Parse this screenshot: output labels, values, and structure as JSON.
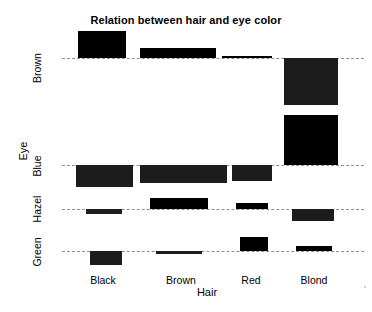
{
  "chart_data": {
    "type": "bar",
    "subtype": "association-plot",
    "title": "Relation between hair and eye color",
    "xlabel": "Hair",
    "ylabel": "Eye",
    "categories": [
      "Black",
      "Brown",
      "Red",
      "Blond"
    ],
    "rows": [
      "Brown",
      "Blue",
      "Hazel",
      "Green"
    ],
    "grid": false,
    "legend": null,
    "note": "Bars rise above the dashed baseline for positive Pearson residuals and drop below for negative residuals; bar width is proportional to sqrt(expected count).",
    "cells": [
      {
        "row": "Brown",
        "col": "Black",
        "sign": "positive",
        "x": 78,
        "width": 48,
        "height": 27,
        "residual": 4.4
      },
      {
        "row": "Brown",
        "col": "Brown",
        "sign": "positive",
        "x": 140,
        "width": 76,
        "height": 10,
        "residual": 1.2
      },
      {
        "row": "Brown",
        "col": "Red",
        "sign": "positive",
        "x": 222,
        "width": 50,
        "height": 2,
        "residual": 0.2
      },
      {
        "row": "Brown",
        "col": "Blond",
        "sign": "negative",
        "x": 284,
        "width": 54,
        "height": 47,
        "residual": -6.0
      },
      {
        "row": "Blue",
        "col": "Black",
        "sign": "negative",
        "x": 76,
        "width": 57,
        "height": 22,
        "residual": -3.1
      },
      {
        "row": "Blue",
        "col": "Brown",
        "sign": "negative",
        "x": 140,
        "width": 87,
        "height": 18,
        "residual": -2.0
      },
      {
        "row": "Blue",
        "col": "Red",
        "sign": "negative",
        "x": 232,
        "width": 40,
        "height": 16,
        "residual": -1.7
      },
      {
        "row": "Blue",
        "col": "Blond",
        "sign": "positive",
        "x": 284,
        "width": 54,
        "height": 50,
        "residual": 7.3
      },
      {
        "row": "Hazel",
        "col": "Black",
        "sign": "negative",
        "x": 86,
        "width": 36,
        "height": 5,
        "residual": -0.5
      },
      {
        "row": "Hazel",
        "col": "Brown",
        "sign": "positive",
        "x": 150,
        "width": 58,
        "height": 11,
        "residual": 1.2
      },
      {
        "row": "Hazel",
        "col": "Red",
        "sign": "positive",
        "x": 236,
        "width": 32,
        "height": 6,
        "residual": 0.6
      },
      {
        "row": "Hazel",
        "col": "Blond",
        "sign": "negative",
        "x": 292,
        "width": 42,
        "height": 12,
        "residual": -1.2
      },
      {
        "row": "Green",
        "col": "Black",
        "sign": "negative",
        "x": 90,
        "width": 32,
        "height": 14,
        "residual": -1.5
      },
      {
        "row": "Green",
        "col": "Brown",
        "sign": "negative",
        "x": 156,
        "width": 46,
        "height": 3,
        "residual": -0.3
      },
      {
        "row": "Green",
        "col": "Red",
        "sign": "positive",
        "x": 240,
        "width": 28,
        "height": 14,
        "residual": 2.0
      },
      {
        "row": "Green",
        "col": "Blond",
        "sign": "positive",
        "x": 296,
        "width": 36,
        "height": 5,
        "residual": 0.6
      }
    ],
    "baselines": [
      {
        "row": "Brown",
        "y": 58
      },
      {
        "row": "Blue",
        "y": 165
      },
      {
        "row": "Hazel",
        "y": 209
      },
      {
        "row": "Green",
        "y": 251
      }
    ]
  },
  "ylabels": {
    "brown": "Brown",
    "blue": "Blue",
    "hazel": "Hazel",
    "green": "Green"
  },
  "xlabels": {
    "black": "Black",
    "brown": "Brown",
    "red": "Red",
    "blond": "Blond"
  },
  "axis_titles": {
    "x": "Hair",
    "y": "Eye"
  },
  "title": "Relation between hair and eye color",
  "colors": {
    "bar_positive": "#000000",
    "bar_negative": "#1c1c1c",
    "baseline": "#8f8f8f",
    "background": "#ffffff",
    "text": "#000000"
  }
}
